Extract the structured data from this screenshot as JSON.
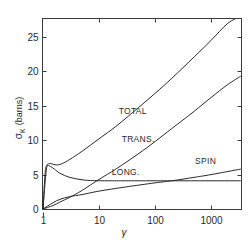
{
  "chart_data": {
    "type": "line",
    "title": "",
    "xlabel": "γ",
    "ylabel": "σK (barns)",
    "xscale": "log",
    "xlim": [
      1,
      3400
    ],
    "ylim": [
      0,
      28
    ],
    "grid": false,
    "legend": "inline curve labels",
    "x_ticks": [
      1,
      10,
      100,
      1000
    ],
    "x_tick_labels": [
      "1",
      "10",
      "100",
      "1000"
    ],
    "y_ticks": [
      0,
      5,
      10,
      15,
      20,
      25
    ],
    "y_tick_labels": [
      "0",
      "5",
      "10",
      "15",
      "20",
      "25"
    ],
    "series": [
      {
        "name": "TOTAL",
        "x": [
          1,
          1.15,
          1.3,
          1.5,
          1.8,
          2.2,
          3,
          5,
          10,
          20,
          50,
          100,
          200,
          500,
          1000,
          2000,
          3400
        ],
        "values": [
          0,
          5.8,
          6.6,
          6.5,
          6.4,
          6.6,
          7.2,
          8.4,
          10.2,
          12.0,
          14.7,
          16.8,
          19.0,
          22.1,
          24.5,
          27.0,
          28.0
        ]
      },
      {
        "name": "TRANS.",
        "x": [
          1,
          1.5,
          2,
          3,
          5,
          10,
          20,
          50,
          100,
          200,
          500,
          1000,
          2000,
          3400
        ],
        "values": [
          0,
          0.5,
          1.0,
          1.7,
          2.7,
          4.3,
          5.8,
          8.0,
          9.8,
          11.7,
          14.2,
          16.2,
          18.1,
          19.3
        ]
      },
      {
        "name": "LONG.",
        "x": [
          1,
          1.1,
          1.2,
          1.35,
          1.6,
          2,
          3,
          5,
          8,
          15,
          30,
          100,
          1000,
          3400
        ],
        "values": [
          0,
          5.5,
          6.3,
          6.2,
          5.8,
          5.2,
          4.6,
          4.25,
          4.12,
          4.1,
          4.1,
          4.1,
          4.1,
          4.1
        ]
      },
      {
        "name": "SPIN",
        "x": [
          1,
          1.5,
          2,
          3,
          5,
          10,
          30,
          100,
          200,
          500,
          1000,
          3400
        ],
        "values": [
          0,
          0.9,
          1.4,
          1.8,
          2.1,
          2.6,
          3.2,
          3.8,
          4.1,
          4.6,
          5.0,
          5.8
        ]
      }
    ],
    "annotations": [
      {
        "text": "TOTAL",
        "x": 40,
        "y": 13.8
      },
      {
        "text": "TRANS.",
        "x": 50,
        "y": 9.8
      },
      {
        "text": "LONG.",
        "x": 30,
        "y": 4.9
      },
      {
        "text": "SPIN",
        "x": 800,
        "y": 6.6
      }
    ]
  },
  "axes": {
    "ylabel_main": "σ",
    "ylabel_sub": "K",
    "ylabel_unit": "(barns)",
    "xlabel": "γ"
  }
}
